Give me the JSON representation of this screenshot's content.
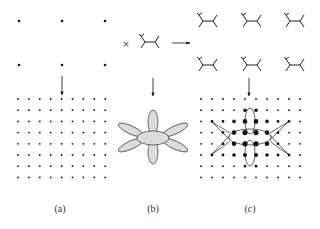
{
  "panels": [
    {
      "id": "a",
      "label": "(a)",
      "description": "Sparse 3x2 lattice mapped down to dense 9x8 lattice"
    },
    {
      "id": "b",
      "label": "(b)",
      "description": "Molecule with six lobes: central ellipse, two vertical lobes, four diagonal lobes"
    },
    {
      "id": "c",
      "label": "(c)",
      "description": "Molecule embedded on dense 10x8 lattice with enlarged occupied sites"
    }
  ],
  "symbols": {
    "multiply": "×"
  },
  "colors": {
    "ink": "#111111",
    "lobe_fill": "#dcdcdc",
    "lobe_stroke": "#333333",
    "background": "#ffffff"
  },
  "icons": [
    "arrow-down-icon",
    "arrow-right-icon",
    "molecule-icon",
    "lattice-dot-icon"
  ]
}
